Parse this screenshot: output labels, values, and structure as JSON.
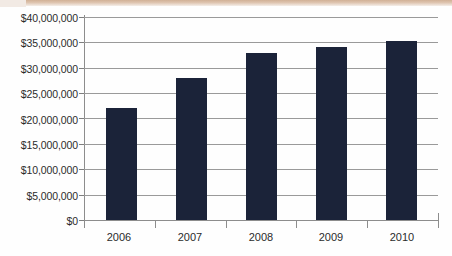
{
  "chart_data": {
    "type": "bar",
    "title": "",
    "xlabel": "",
    "ylabel": "",
    "categories": [
      "2006",
      "2007",
      "2008",
      "2009",
      "2010"
    ],
    "values": [
      22000000,
      28000000,
      33000000,
      34000000,
      35300000
    ],
    "ylim": [
      0,
      40000000
    ],
    "ytick_values": [
      0,
      5000000,
      10000000,
      15000000,
      20000000,
      25000000,
      30000000,
      35000000,
      40000000
    ],
    "ytick_labels": [
      "$0",
      "$5,000,000",
      "$10,000,000",
      "$15,000,000",
      "$20,000,000",
      "$25,000,000",
      "$30,000,000",
      "$35,000,000",
      "$40,000,000"
    ],
    "grid": true,
    "legend": false,
    "legend_position": "none",
    "series": [
      {
        "name": "",
        "values": [
          22000000,
          28000000,
          33000000,
          34000000,
          35300000
        ]
      }
    ],
    "colors": {
      "bar": "#1b2339",
      "gridline": "#9a9a9a",
      "axis": "#8d8d8d",
      "text": "#2b2b2b",
      "background": "#fefefe"
    }
  }
}
